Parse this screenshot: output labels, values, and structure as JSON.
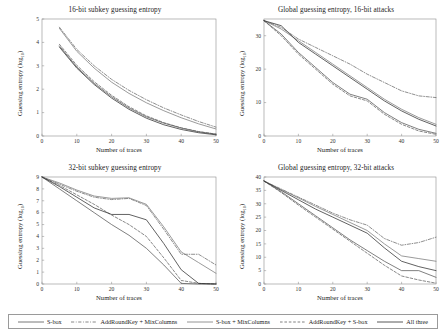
{
  "figure": {
    "xlabel": "Number of traces",
    "ylabel": "Guessing entropy (log",
    "ylabel_sub": "10",
    "ylabel_close": ")"
  },
  "legend": {
    "items": [
      {
        "label": "S-box",
        "style": "solid",
        "color": "#4d4d4d"
      },
      {
        "label": "AddRoundKey + MixColumns",
        "style": "dashdot",
        "color": "#555555"
      },
      {
        "label": "S-box + MixColumns",
        "style": "solid",
        "color": "#6e6e6e"
      },
      {
        "label": "AddRoundKey + S-box",
        "style": "dashed",
        "color": "#5a5a5a"
      },
      {
        "label": "All three",
        "style": "solid",
        "color": "#2b2b2b"
      }
    ]
  },
  "chart_data": [
    {
      "type": "line",
      "panel": "top-left",
      "title": "16-bit subkey guessing entropy",
      "xlabel": "Number of traces",
      "ylabel": "Guessing entropy (log10)",
      "xlim": [
        0,
        50
      ],
      "ylim": [
        0,
        5
      ],
      "xticks": [
        0,
        10,
        20,
        30,
        40,
        50
      ],
      "yticks": [
        0,
        1,
        2,
        3,
        4,
        5
      ],
      "grid": false,
      "legend_position": "figure-bottom",
      "x": [
        5,
        10,
        15,
        20,
        25,
        30,
        35,
        40,
        45,
        50
      ],
      "series": [
        {
          "name": "S-box",
          "style": "solid",
          "values": [
            3.85,
            2.95,
            2.25,
            1.68,
            1.2,
            0.82,
            0.55,
            0.34,
            0.18,
            0.08
          ]
        },
        {
          "name": "AddRoundKey + MixColumns",
          "style": "dashdot",
          "values": [
            4.65,
            3.7,
            3.0,
            2.42,
            1.95,
            1.55,
            1.2,
            0.9,
            0.62,
            0.38
          ]
        },
        {
          "name": "S-box + MixColumns",
          "style": "solid",
          "values": [
            4.6,
            3.62,
            2.9,
            2.3,
            1.82,
            1.42,
            1.08,
            0.78,
            0.52,
            0.3
          ]
        },
        {
          "name": "AddRoundKey + S-box",
          "style": "dashed",
          "values": [
            3.92,
            3.02,
            2.32,
            1.74,
            1.25,
            0.86,
            0.57,
            0.35,
            0.19,
            0.08
          ]
        },
        {
          "name": "All three",
          "style": "solid",
          "values": [
            3.8,
            2.9,
            2.2,
            1.62,
            1.14,
            0.76,
            0.48,
            0.28,
            0.14,
            0.05
          ]
        }
      ]
    },
    {
      "type": "line",
      "panel": "top-right",
      "title": "Global guessing entropy, 16-bit attacks",
      "xlabel": "Number of traces",
      "ylabel": "Guessing entropy (log10)",
      "xlim": [
        0,
        50
      ],
      "ylim": [
        0,
        35
      ],
      "xticks": [
        0,
        10,
        20,
        30,
        40,
        50
      ],
      "yticks": [
        0,
        10,
        20,
        30
      ],
      "grid": false,
      "legend_position": "figure-bottom",
      "x": [
        0,
        5,
        10,
        15,
        20,
        25,
        30,
        35,
        40,
        45,
        50
      ],
      "series": [
        {
          "name": "S-box",
          "style": "solid",
          "values": [
            34.5,
            30.5,
            25.0,
            20.5,
            16.0,
            12.5,
            11.0,
            7.0,
            4.0,
            2.0,
            0.8
          ]
        },
        {
          "name": "AddRoundKey + MixColumns",
          "style": "dashdot",
          "values": [
            34.5,
            32.5,
            29.0,
            26.5,
            24.0,
            21.5,
            18.5,
            16.0,
            13.5,
            12.0,
            11.5
          ]
        },
        {
          "name": "S-box + MixColumns",
          "style": "solid",
          "values": [
            34.5,
            32.0,
            28.5,
            25.0,
            21.5,
            18.0,
            14.5,
            11.0,
            8.0,
            5.5,
            3.5
          ]
        },
        {
          "name": "AddRoundKey + S-box",
          "style": "dashed",
          "values": [
            34.5,
            30.0,
            24.5,
            20.0,
            15.5,
            12.0,
            10.5,
            6.5,
            3.5,
            1.5,
            0.5
          ]
        },
        {
          "name": "All three",
          "style": "solid",
          "values": [
            34.5,
            33.0,
            28.0,
            24.5,
            21.0,
            17.5,
            14.0,
            10.5,
            7.5,
            5.0,
            3.0
          ]
        }
      ]
    },
    {
      "type": "line",
      "panel": "bottom-left",
      "title": "32-bit subkey guessing entropy",
      "xlabel": "Number of traces",
      "ylabel": "Guessing entropy (log10)",
      "xlim": [
        0,
        50
      ],
      "ylim": [
        0,
        9
      ],
      "xticks": [
        0,
        10,
        20,
        30,
        40,
        50
      ],
      "yticks": [
        0,
        1,
        2,
        3,
        4,
        5,
        6,
        7,
        8,
        9
      ],
      "grid": false,
      "legend_position": "figure-bottom",
      "x": [
        0,
        5,
        10,
        15,
        20,
        25,
        30,
        35,
        40,
        45,
        50
      ],
      "series": [
        {
          "name": "S-box",
          "style": "solid",
          "values": [
            9.0,
            8.0,
            7.0,
            6.0,
            5.0,
            4.1,
            3.0,
            1.6,
            0.05,
            0.0,
            0.0
          ]
        },
        {
          "name": "AddRoundKey + MixColumns",
          "style": "dashdot",
          "values": [
            9.0,
            8.4,
            7.8,
            7.3,
            7.1,
            7.2,
            6.6,
            4.6,
            2.5,
            2.5,
            1.6
          ]
        },
        {
          "name": "S-box + MixColumns",
          "style": "solid",
          "values": [
            9.0,
            8.5,
            7.9,
            7.4,
            7.2,
            7.25,
            6.7,
            4.8,
            2.7,
            1.8,
            0.9
          ]
        },
        {
          "name": "AddRoundKey + S-box",
          "style": "dashed",
          "values": [
            9.0,
            8.3,
            7.5,
            6.7,
            5.8,
            5.0,
            4.0,
            2.2,
            0.3,
            0.05,
            0.0
          ]
        },
        {
          "name": "All three",
          "style": "solid",
          "values": [
            9.0,
            8.2,
            7.3,
            6.4,
            5.85,
            5.85,
            5.4,
            3.4,
            1.2,
            0.05,
            0.0
          ]
        }
      ]
    },
    {
      "type": "line",
      "panel": "bottom-right",
      "title": "Global guessing entropy, 32-bit attacks",
      "xlabel": "Number of traces",
      "ylabel": "Guessing entropy (log10)",
      "xlim": [
        0,
        50
      ],
      "ylim": [
        0,
        40
      ],
      "xticks": [
        0,
        10,
        20,
        30,
        40,
        50
      ],
      "yticks": [
        0,
        5,
        10,
        15,
        20,
        25,
        30,
        35,
        40
      ],
      "grid": false,
      "legend_position": "figure-bottom",
      "x": [
        0,
        5,
        10,
        15,
        20,
        25,
        30,
        35,
        40,
        45,
        50
      ],
      "series": [
        {
          "name": "S-box",
          "style": "solid",
          "values": [
            38.5,
            34.5,
            30.0,
            25.5,
            21.0,
            16.5,
            12.5,
            8.5,
            5.0,
            5.0,
            2.5
          ]
        },
        {
          "name": "AddRoundKey + MixColumns",
          "style": "dashdot",
          "values": [
            38.5,
            35.5,
            32.5,
            29.5,
            26.5,
            24.0,
            22.0,
            17.0,
            14.5,
            15.5,
            17.5
          ]
        },
        {
          "name": "S-box + MixColumns",
          "style": "solid",
          "values": [
            38.5,
            35.3,
            32.2,
            29.0,
            26.0,
            23.0,
            20.0,
            15.0,
            10.5,
            9.5,
            8.5
          ]
        },
        {
          "name": "AddRoundKey + S-box",
          "style": "dashed",
          "values": [
            38.5,
            34.2,
            29.5,
            25.0,
            20.5,
            16.0,
            11.5,
            7.0,
            3.0,
            1.5,
            0.3
          ]
        },
        {
          "name": "All three",
          "style": "solid",
          "values": [
            38.5,
            35.0,
            31.5,
            28.0,
            25.0,
            22.0,
            19.0,
            13.5,
            8.5,
            6.5,
            5.0
          ]
        }
      ]
    }
  ]
}
